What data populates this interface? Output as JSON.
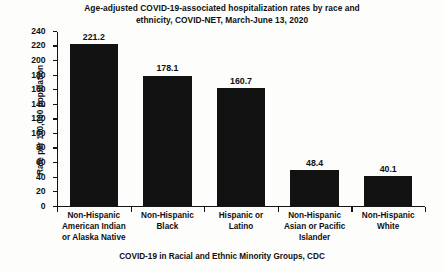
{
  "chart_data": {
    "type": "bar",
    "title": "Age-adjusted COVID-19-associated hospitalization rates by race and ethnicity, COVID-NET, March-June 13, 2020",
    "title_line1": "Age-adjusted COVID-19-associated hospitalization rates by race and",
    "title_line2": "ethnicity, COVID-NET, March-June 13, 2020",
    "caption": "COVID-19 in Racial and Ethnic Minority Groups, CDC",
    "xlabel": "",
    "ylabel": "Rate per 100,000 population",
    "ylim": [
      0,
      240
    ],
    "ytick_step": 20,
    "grid": false,
    "legend": false,
    "bar_color": "#121212",
    "background_color": "#fdfdfc",
    "axis_color": "#141414",
    "categories": [
      "Non-Hispanic American Indian or Alaska Native",
      "Non-Hispanic Black",
      "Hispanic or Latino",
      "Non-Hispanic Asian or Pacific Islander",
      "Non-Hispanic White"
    ],
    "category_label_lines": [
      [
        "Non-Hispanic",
        "American Indian",
        "or Alaska Native"
      ],
      [
        "Non-Hispanic",
        "Black"
      ],
      [
        "Hispanic or",
        "Latino"
      ],
      [
        "Non-Hispanic",
        "Asian or Pacific",
        "Islander"
      ],
      [
        "Non-Hispanic",
        "White"
      ]
    ],
    "values": [
      221.2,
      178.1,
      160.7,
      48.4,
      40.1
    ],
    "value_labels": [
      "221.2",
      "178.1",
      "160.7",
      "48.4",
      "40.1"
    ],
    "yticks": [
      0,
      20,
      40,
      60,
      80,
      100,
      120,
      140,
      160,
      180,
      200,
      220,
      240
    ],
    "ytick_labels": [
      "0",
      "20",
      "40",
      "60",
      "80",
      "100",
      "120",
      "140",
      "160",
      "180",
      "200",
      "220",
      "240"
    ]
  }
}
